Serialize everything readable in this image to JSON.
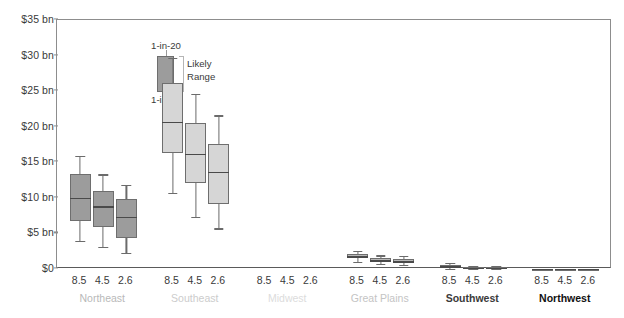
{
  "chart_data": {
    "type": "box",
    "title": "",
    "xlabel": "",
    "ylabel": "",
    "ylim": [
      0,
      35
    ],
    "y_ticks": [
      0,
      5,
      10,
      15,
      20,
      25,
      30,
      35
    ],
    "y_tick_labels": [
      "$0",
      "$5 bn",
      "$10 bn",
      "$15 bn",
      "$20 bn",
      "$25 bn",
      "$30 bn",
      "$35 bn"
    ],
    "grid": false,
    "legend_position": "inside-top-left",
    "legend": {
      "upper_whisker_label": "1-in-20",
      "lower_whisker_label": "1-in-20",
      "box_label_line1": "Likely",
      "box_label_line2": "Range"
    },
    "subcategories": [
      "8.5",
      "4.5",
      "2.6"
    ],
    "groups": [
      {
        "name": "Northeast",
        "label_color": "#b9b9b9",
        "fill": "#9c9c9c",
        "boxes": [
          {
            "x": "8.5",
            "whisker_low": 4.0,
            "q1": 6.8,
            "median": 10.0,
            "q3": 13.4,
            "whisker_high": 15.9
          },
          {
            "x": "4.5",
            "whisker_low": 3.1,
            "q1": 5.9,
            "median": 8.8,
            "q3": 11.0,
            "whisker_high": 13.3
          },
          {
            "x": "2.6",
            "whisker_low": 2.3,
            "q1": 4.3,
            "median": 7.3,
            "q3": 9.8,
            "whisker_high": 11.8
          }
        ]
      },
      {
        "name": "Southeast",
        "label_color": "#cccccc",
        "fill": "#d6d6d6",
        "boxes": [
          {
            "x": "8.5",
            "whisker_low": 10.7,
            "q1": 16.3,
            "median": 20.7,
            "q3": 26.1,
            "whisker_high": 29.7
          },
          {
            "x": "4.5",
            "whisker_low": 7.3,
            "q1": 12.1,
            "median": 16.2,
            "q3": 20.5,
            "whisker_high": 24.6
          },
          {
            "x": "2.6",
            "whisker_low": 5.7,
            "q1": 9.1,
            "median": 13.7,
            "q3": 17.6,
            "whisker_high": 21.6
          }
        ]
      },
      {
        "name": "Midwest",
        "label_color": "#dcdcdc",
        "fill": "#e4e4e4",
        "boxes": [
          {
            "x": "8.5",
            "whisker_low": 0.0,
            "q1": 0.0,
            "median": 0.0,
            "q3": 0.0,
            "whisker_high": 0.0
          },
          {
            "x": "4.5",
            "whisker_low": 0.0,
            "q1": 0.0,
            "median": 0.0,
            "q3": 0.0,
            "whisker_high": 0.0
          },
          {
            "x": "2.6",
            "whisker_low": 0.0,
            "q1": 0.0,
            "median": 0.0,
            "q3": 0.0,
            "whisker_high": 0.0
          }
        ]
      },
      {
        "name": "Great Plains",
        "label_color": "#c4c4c4",
        "fill": "#b8b8b8",
        "boxes": [
          {
            "x": "8.5",
            "whisker_low": 1.0,
            "q1": 1.5,
            "median": 1.8,
            "q3": 2.1,
            "whisker_high": 2.6
          },
          {
            "x": "4.5",
            "whisker_low": 0.7,
            "q1": 1.0,
            "median": 1.2,
            "q3": 1.5,
            "whisker_high": 1.9
          },
          {
            "x": "2.6",
            "whisker_low": 0.6,
            "q1": 0.9,
            "median": 1.1,
            "q3": 1.4,
            "whisker_high": 1.8
          }
        ]
      },
      {
        "name": "Southwest",
        "label_color": "#3a3a3a",
        "fill": "#8f8f8f",
        "boxes": [
          {
            "x": "8.5",
            "whisker_low": 0.05,
            "q1": 0.25,
            "median": 0.4,
            "q3": 0.6,
            "whisker_high": 0.9
          },
          {
            "x": "4.5",
            "whisker_low": 0.03,
            "q1": 0.12,
            "median": 0.2,
            "q3": 0.28,
            "whisker_high": 0.45
          },
          {
            "x": "2.6",
            "whisker_low": 0.02,
            "q1": 0.1,
            "median": 0.16,
            "q3": 0.24,
            "whisker_high": 0.4
          }
        ]
      },
      {
        "name": "Northwest",
        "label_color": "#111111",
        "fill": "#5a5a5a",
        "boxes": [
          {
            "x": "8.5",
            "whisker_low": 0.0,
            "q1": 0.0,
            "median": 0.02,
            "q3": 0.04,
            "whisker_high": 0.06
          },
          {
            "x": "4.5",
            "whisker_low": 0.0,
            "q1": 0.0,
            "median": 0.01,
            "q3": 0.03,
            "whisker_high": 0.05
          },
          {
            "x": "2.6",
            "whisker_low": 0.0,
            "q1": 0.0,
            "median": 0.01,
            "q3": 0.02,
            "whisker_high": 0.04
          }
        ]
      }
    ]
  }
}
